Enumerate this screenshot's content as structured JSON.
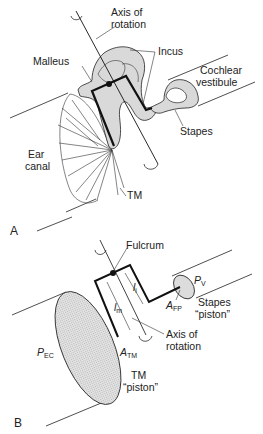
{
  "figure": {
    "panel_a": {
      "panel_label": "A",
      "labels": {
        "axis_of_rotation_line1": "Axis of",
        "axis_of_rotation_line2": "rotation",
        "incus": "Incus",
        "malleus": "Malleus",
        "cochlear_line1": "Cochlear",
        "cochlear_line2": "vestibule",
        "stapes": "Stapes",
        "ear_line1": "Ear",
        "ear_line2": "canal",
        "tm": "TM"
      }
    },
    "panel_b": {
      "panel_label": "B",
      "labels": {
        "fulcrum": "Fulcrum",
        "pv_main": "P",
        "pv_sub": "V",
        "afp_main": "A",
        "afp_sub": "FP",
        "stapes_piston_line1": "Stapes",
        "stapes_piston_line2": "“piston”",
        "lm_main": "l",
        "lm_sub": "m",
        "li_main": "l",
        "li_sub": "i",
        "axis_of_rotation_line1": "Axis of",
        "axis_of_rotation_line2": "rotation",
        "pec_main": "P",
        "pec_sub": "EC",
        "atm_main": "A",
        "atm_sub": "TM",
        "tm_piston_line1": "TM",
        "tm_piston_line2": "“piston”"
      }
    },
    "colors": {
      "bone_fill": "#d9d9d9",
      "piston_fill": "#dcdcdc",
      "stroke": "#111111",
      "thin_stroke": "#333333"
    }
  }
}
